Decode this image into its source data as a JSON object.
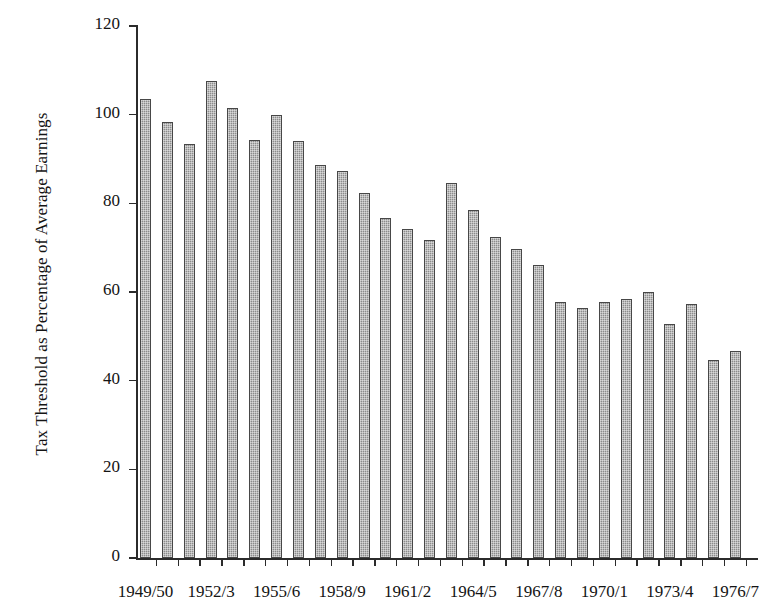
{
  "chart_data": {
    "type": "bar",
    "title": "",
    "xlabel": "",
    "ylabel": "Tax Threshold as Percentage of Average Earnings",
    "ylim": [
      0,
      120
    ],
    "ytick_values": [
      0,
      20,
      40,
      60,
      80,
      100,
      120
    ],
    "ytick_labels": [
      "0",
      "20",
      "40",
      "60",
      "80",
      "100",
      "120"
    ],
    "grid": false,
    "legend": "none",
    "categories": [
      "1949/50",
      "1950/1",
      "1951/2",
      "1952/3",
      "1953/4",
      "1954/5",
      "1955/6",
      "1956/7",
      "1957/8",
      "1958/9",
      "1959/60",
      "1960/1",
      "1961/2",
      "1962/3",
      "1963/4",
      "1964/5",
      "1965/6",
      "1966/7",
      "1967/8",
      "1968/9",
      "1969/70",
      "1970/1",
      "1971/2",
      "1972/3",
      "1973/4",
      "1974/5",
      "1975/6",
      "1976/7"
    ],
    "values": [
      103.5,
      98.3,
      93.3,
      107.7,
      101.5,
      94.4,
      100.0,
      94.0,
      88.7,
      87.3,
      82.4,
      76.8,
      74.2,
      71.7,
      84.7,
      78.5,
      72.5,
      69.8,
      66.2,
      57.7,
      56.3,
      57.8,
      58.5,
      60.0,
      52.8,
      57.2,
      44.6,
      46.8
    ],
    "xtick_labels_shown": [
      "1949/50",
      "1952/3",
      "1955/6",
      "1958/9",
      "1961/2",
      "1964/5",
      "1967/8",
      "1970/1",
      "1973/4",
      "1976/7"
    ],
    "xtick_label_indices": [
      0,
      3,
      6,
      9,
      12,
      15,
      18,
      21,
      24,
      27
    ],
    "bar_color": "#8c8c8c",
    "bar_edge_color": "#474747",
    "axis_color": "#2b2b2b"
  }
}
